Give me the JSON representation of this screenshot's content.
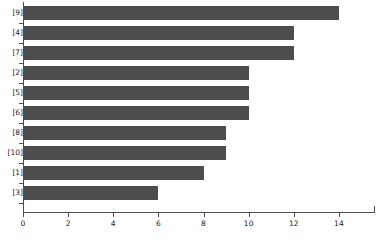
{
  "chart_data": {
    "type": "bar",
    "orientation": "horizontal",
    "title": "",
    "xlabel": "",
    "ylabel": "",
    "categories": [
      "[9]",
      "[4]",
      "[7]",
      "[2]",
      "[5]",
      "[6]",
      "[8]",
      "[10]",
      "[1]",
      "[3]"
    ],
    "values": [
      14,
      12,
      12,
      10,
      10,
      10,
      9,
      9,
      8,
      6
    ],
    "xlim": [
      0,
      15.6
    ],
    "xticks": [
      0,
      2,
      4,
      6,
      8,
      10,
      12,
      14
    ],
    "xticklabels": [
      "0",
      "2",
      "4",
      "6",
      "8",
      "10",
      "12",
      "14"
    ],
    "grid": false,
    "legend": false,
    "bar_color": "#4d4d4d",
    "axis_color": "#4d4d4d",
    "background_color": "#ffffff"
  }
}
